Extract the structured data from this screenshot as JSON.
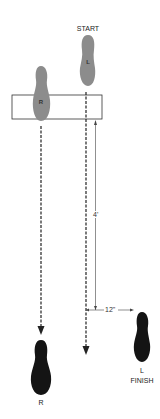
{
  "diagram": {
    "labels": {
      "start": "START",
      "finish": "FINISH",
      "start_foot": "L",
      "mid_foot": "R",
      "end_right_foot": "R",
      "end_left_foot": "L"
    },
    "dimensions": {
      "vertical": "4'",
      "horizontal": "12\""
    },
    "colors": {
      "start_footprint": "#8c8c8c",
      "end_footprint": "#141414",
      "line": "#222222",
      "box_border": "#333333"
    }
  }
}
